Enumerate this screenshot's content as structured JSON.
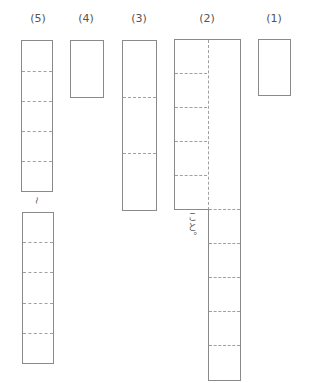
{
  "questions": [
    {
      "label": "(5)",
      "cells_upper": 5,
      "cells_lower": 5,
      "continuation_mark": "~"
    },
    {
      "label": "(4)",
      "cells": 1
    },
    {
      "label": "(3)",
      "cells": 3
    },
    {
      "label": "(2)",
      "columns": 2,
      "left_cells": 5,
      "right_cells": 10,
      "left_suffix": "こと。"
    },
    {
      "label": "(1)",
      "cells": 1
    }
  ]
}
